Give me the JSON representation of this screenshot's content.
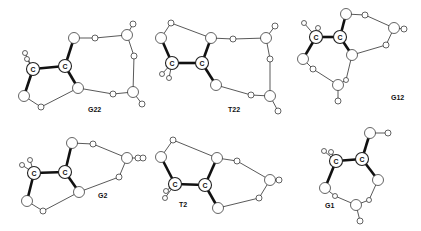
{
  "figure": {
    "molecules": [
      {
        "id": "G22",
        "label": "G22",
        "label_pos": [
          88,
          112
        ],
        "atoms": [
          {
            "x": 33,
            "y": 69,
            "r": 6.5,
            "text": "C"
          },
          {
            "x": 65,
            "y": 66,
            "r": 6.5,
            "text": "C"
          },
          {
            "x": 25,
            "y": 53,
            "r": 2.5
          },
          {
            "x": 27,
            "y": 59,
            "r": 2.5
          },
          {
            "x": 74,
            "y": 38,
            "r": 5.5
          },
          {
            "x": 95,
            "y": 38,
            "r": 3
          },
          {
            "x": 127,
            "y": 35,
            "r": 5.5
          },
          {
            "x": 133,
            "y": 24,
            "r": 3
          },
          {
            "x": 134,
            "y": 56,
            "r": 3
          },
          {
            "x": 133,
            "y": 92,
            "r": 5.5
          },
          {
            "x": 142,
            "y": 104,
            "r": 3
          },
          {
            "x": 113,
            "y": 94,
            "r": 3
          },
          {
            "x": 78,
            "y": 88,
            "r": 5.5
          },
          {
            "x": 24,
            "y": 96,
            "r": 5.5
          },
          {
            "x": 41,
            "y": 107,
            "r": 3
          }
        ],
        "bonds": [
          [
            0,
            1,
            "bold"
          ],
          [
            1,
            4,
            "bold"
          ],
          [
            1,
            12,
            "bold"
          ],
          [
            0,
            13,
            "bold"
          ],
          [
            0,
            2,
            "thin"
          ],
          [
            0,
            3,
            "thin"
          ],
          [
            4,
            5,
            "thin"
          ],
          [
            5,
            6,
            "thin"
          ],
          [
            6,
            7,
            "thin"
          ],
          [
            6,
            8,
            "thin"
          ],
          [
            8,
            9,
            "thin"
          ],
          [
            9,
            10,
            "thin"
          ],
          [
            9,
            11,
            "thin"
          ],
          [
            11,
            12,
            "thin"
          ],
          [
            12,
            14,
            "thin"
          ],
          [
            14,
            13,
            "thin"
          ]
        ]
      },
      {
        "id": "T22",
        "label": "T22",
        "label_pos": [
          228,
          112
        ],
        "atoms": [
          {
            "x": 172,
            "y": 63,
            "r": 6.5,
            "text": "C"
          },
          {
            "x": 202,
            "y": 63,
            "r": 6.5,
            "text": "C"
          },
          {
            "x": 161,
            "y": 38,
            "r": 5.5
          },
          {
            "x": 171,
            "y": 23,
            "r": 3
          },
          {
            "x": 162,
            "y": 74,
            "r": 2.5
          },
          {
            "x": 169,
            "y": 78,
            "r": 2.5
          },
          {
            "x": 211,
            "y": 38,
            "r": 5.5
          },
          {
            "x": 233,
            "y": 39,
            "r": 3
          },
          {
            "x": 266,
            "y": 38,
            "r": 5.5
          },
          {
            "x": 275,
            "y": 26,
            "r": 3
          },
          {
            "x": 270,
            "y": 59,
            "r": 3
          },
          {
            "x": 270,
            "y": 96,
            "r": 5.5
          },
          {
            "x": 278,
            "y": 111,
            "r": 3
          },
          {
            "x": 251,
            "y": 95,
            "r": 3
          },
          {
            "x": 216,
            "y": 85,
            "r": 5.5
          }
        ],
        "bonds": [
          [
            0,
            1,
            "bold"
          ],
          [
            0,
            2,
            "bold"
          ],
          [
            1,
            6,
            "bold"
          ],
          [
            1,
            14,
            "bold"
          ],
          [
            2,
            3,
            "thin"
          ],
          [
            3,
            6,
            "thin"
          ],
          [
            0,
            4,
            "thin"
          ],
          [
            0,
            5,
            "thin"
          ],
          [
            6,
            7,
            "thin"
          ],
          [
            7,
            8,
            "thin"
          ],
          [
            8,
            9,
            "thin"
          ],
          [
            8,
            10,
            "thin"
          ],
          [
            10,
            11,
            "thin"
          ],
          [
            11,
            12,
            "thin"
          ],
          [
            11,
            13,
            "thin"
          ],
          [
            13,
            14,
            "thin"
          ]
        ]
      },
      {
        "id": "G12",
        "label": "G12",
        "label_pos": [
          391,
          100
        ],
        "atoms": [
          {
            "x": 316,
            "y": 37,
            "r": 6.5,
            "text": "C"
          },
          {
            "x": 340,
            "y": 37,
            "r": 6.5,
            "text": "C"
          },
          {
            "x": 304,
            "y": 23,
            "r": 2.5
          },
          {
            "x": 318,
            "y": 28,
            "r": 2.5
          },
          {
            "x": 346,
            "y": 14,
            "r": 5.5
          },
          {
            "x": 365,
            "y": 15,
            "r": 3
          },
          {
            "x": 394,
            "y": 28,
            "r": 5.5
          },
          {
            "x": 404,
            "y": 29,
            "r": 3
          },
          {
            "x": 386,
            "y": 45,
            "r": 3
          },
          {
            "x": 352,
            "y": 55,
            "r": 5.5
          },
          {
            "x": 303,
            "y": 59,
            "r": 5.5
          },
          {
            "x": 313,
            "y": 69,
            "r": 3
          },
          {
            "x": 338,
            "y": 85,
            "r": 5.5
          },
          {
            "x": 346,
            "y": 80,
            "r": 2.5
          },
          {
            "x": 338,
            "y": 101,
            "r": 3
          }
        ],
        "bonds": [
          [
            0,
            1,
            "bold"
          ],
          [
            1,
            4,
            "bold"
          ],
          [
            1,
            9,
            "bold"
          ],
          [
            0,
            10,
            "bold"
          ],
          [
            0,
            2,
            "thin"
          ],
          [
            0,
            3,
            "thin"
          ],
          [
            4,
            5,
            "thin"
          ],
          [
            5,
            6,
            "thin"
          ],
          [
            6,
            7,
            "thin"
          ],
          [
            6,
            8,
            "thin"
          ],
          [
            8,
            9,
            "thin"
          ],
          [
            9,
            13,
            "thin"
          ],
          [
            13,
            12,
            "thin"
          ],
          [
            12,
            14,
            "thin"
          ],
          [
            12,
            11,
            "thin"
          ],
          [
            11,
            10,
            "thin"
          ]
        ]
      },
      {
        "id": "G2",
        "label": "G2",
        "label_pos": [
          98,
          198
        ],
        "atoms": [
          {
            "x": 34,
            "y": 173,
            "r": 6.5,
            "text": "C"
          },
          {
            "x": 65,
            "y": 172,
            "r": 6.5,
            "text": "C"
          },
          {
            "x": 22,
            "y": 165,
            "r": 2.5
          },
          {
            "x": 30,
            "y": 160,
            "r": 2.5
          },
          {
            "x": 72,
            "y": 143,
            "r": 5.5
          },
          {
            "x": 93,
            "y": 144,
            "r": 3
          },
          {
            "x": 127,
            "y": 158,
            "r": 5.5
          },
          {
            "x": 138,
            "y": 158,
            "r": 3
          },
          {
            "x": 119,
            "y": 177,
            "r": 3
          },
          {
            "x": 79,
            "y": 192,
            "r": 5.5
          },
          {
            "x": 27,
            "y": 201,
            "r": 5.5
          },
          {
            "x": 43,
            "y": 211,
            "r": 3
          }
        ],
        "bonds": [
          [
            0,
            1,
            "bold"
          ],
          [
            1,
            4,
            "bold"
          ],
          [
            1,
            9,
            "bold"
          ],
          [
            0,
            10,
            "bold"
          ],
          [
            0,
            2,
            "thin"
          ],
          [
            0,
            3,
            "thin"
          ],
          [
            4,
            5,
            "thin"
          ],
          [
            5,
            6,
            "thin"
          ],
          [
            6,
            7,
            "thin"
          ],
          [
            6,
            8,
            "thin"
          ],
          [
            8,
            9,
            "thin"
          ],
          [
            9,
            11,
            "thin"
          ],
          [
            11,
            10,
            "thin"
          ]
        ]
      },
      {
        "id": "T2",
        "label": "T2",
        "label_pos": [
          179,
          207
        ],
        "atoms": [
          {
            "x": 175,
            "y": 184,
            "r": 6.5,
            "text": "C"
          },
          {
            "x": 205,
            "y": 185,
            "r": 6.5,
            "text": "C"
          },
          {
            "x": 161,
            "y": 157,
            "r": 5.5
          },
          {
            "x": 173,
            "y": 140,
            "r": 3
          },
          {
            "x": 166,
            "y": 191,
            "r": 2.5
          },
          {
            "x": 165,
            "y": 198,
            "r": 2.5
          },
          {
            "x": 217,
            "y": 158,
            "r": 5.5
          },
          {
            "x": 237,
            "y": 161,
            "r": 3
          },
          {
            "x": 270,
            "y": 180,
            "r": 5.5
          },
          {
            "x": 279,
            "y": 180,
            "r": 3
          },
          {
            "x": 259,
            "y": 198,
            "r": 3
          },
          {
            "x": 218,
            "y": 208,
            "r": 5.5
          },
          {
            "x": 143,
            "y": 158,
            "r": 3
          }
        ],
        "bonds": [
          [
            0,
            1,
            "bold"
          ],
          [
            0,
            2,
            "bold"
          ],
          [
            1,
            6,
            "bold"
          ],
          [
            1,
            11,
            "bold"
          ],
          [
            2,
            3,
            "thin"
          ],
          [
            3,
            6,
            "thin"
          ],
          [
            0,
            4,
            "thin"
          ],
          [
            0,
            5,
            "thin"
          ],
          [
            6,
            7,
            "thin"
          ],
          [
            7,
            8,
            "thin"
          ],
          [
            8,
            9,
            "thin"
          ],
          [
            8,
            10,
            "thin"
          ],
          [
            10,
            11,
            "thin"
          ]
        ]
      },
      {
        "id": "G1",
        "label": "G1",
        "label_pos": [
          325,
          208
        ],
        "atoms": [
          {
            "x": 336,
            "y": 161,
            "r": 6.5,
            "text": "C"
          },
          {
            "x": 362,
            "y": 159,
            "r": 6.5,
            "text": "C"
          },
          {
            "x": 324,
            "y": 151,
            "r": 2.5
          },
          {
            "x": 331,
            "y": 152,
            "r": 2.5
          },
          {
            "x": 370,
            "y": 133,
            "r": 5.5
          },
          {
            "x": 388,
            "y": 133,
            "r": 3
          },
          {
            "x": 378,
            "y": 180,
            "r": 5.5
          },
          {
            "x": 325,
            "y": 188,
            "r": 5.5
          },
          {
            "x": 335,
            "y": 196,
            "r": 2.5
          },
          {
            "x": 356,
            "y": 205,
            "r": 5.5
          },
          {
            "x": 369,
            "y": 200,
            "r": 2.5
          },
          {
            "x": 360,
            "y": 221,
            "r": 3
          }
        ],
        "bonds": [
          [
            0,
            1,
            "bold"
          ],
          [
            1,
            4,
            "bold"
          ],
          [
            1,
            6,
            "bold"
          ],
          [
            0,
            7,
            "bold"
          ],
          [
            0,
            2,
            "thin"
          ],
          [
            0,
            3,
            "thin"
          ],
          [
            4,
            5,
            "thin"
          ],
          [
            6,
            10,
            "thin"
          ],
          [
            10,
            9,
            "thin"
          ],
          [
            9,
            11,
            "thin"
          ],
          [
            9,
            8,
            "thin"
          ],
          [
            8,
            7,
            "thin"
          ]
        ]
      }
    ]
  }
}
